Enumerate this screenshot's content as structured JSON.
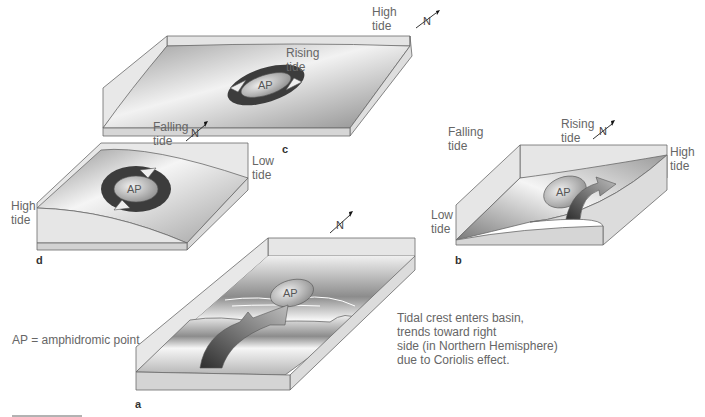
{
  "figure": {
    "panels": [
      {
        "id": "c",
        "label": "c",
        "top_label": "High\ntide",
        "left_label": "Rising\ntide",
        "right_label": "Falling\ntide",
        "north": "N",
        "point": "AP"
      },
      {
        "id": "d",
        "label": "d",
        "top_label": "Falling\ntide",
        "left_label": "High\ntide",
        "right_label": "Low\ntide",
        "north": "N",
        "point": "AP"
      },
      {
        "id": "b",
        "label": "b",
        "top_label": "Rising\ntide",
        "left_label": "Low\ntide",
        "right_label": "High\ntide",
        "north": "N",
        "point": "AP"
      },
      {
        "id": "a",
        "label": "a",
        "north": "N",
        "point": "AP",
        "caption": "Tidal crest enters basin,\ntrends toward right\nside (in Northern Hemisphere)\ndue to Coriolis effect."
      }
    ],
    "legend": "AP = amphidromic point"
  },
  "colors": {
    "basin_side": "#dcdcdc",
    "water_dark": "#7a7a7a",
    "water_light": "#f4f4f4",
    "arrow_dark": "#3a3a3a",
    "outline": "#6a6a6a"
  }
}
